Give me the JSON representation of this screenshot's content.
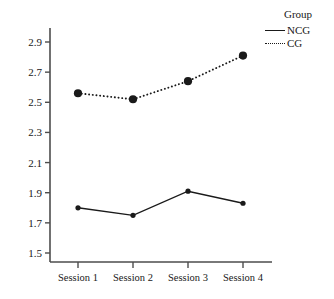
{
  "chart_data": {
    "type": "line",
    "title": "",
    "xlabel": "",
    "ylabel": "",
    "categories": [
      "Session 1",
      "Session 2",
      "Session 3",
      "Session 4"
    ],
    "yticks": [
      "1.5",
      "1.7",
      "1.9",
      "2.1",
      "2.3",
      "2.5",
      "2.7",
      "2.9"
    ],
    "ytick_values": [
      1.5,
      1.7,
      1.9,
      2.1,
      2.3,
      2.5,
      2.7,
      2.9
    ],
    "ylim": [
      1.43,
      2.97
    ],
    "grid": false,
    "legend_position": "top-right",
    "legend_title": "Group",
    "series": [
      {
        "name": "NCG",
        "values": [
          1.8,
          1.75,
          1.91,
          1.83
        ],
        "linestyle": "solid",
        "marker": "circle",
        "marker_size": 4,
        "color": "#1a1a1a"
      },
      {
        "name": "CG",
        "values": [
          2.56,
          2.52,
          2.64,
          2.81
        ],
        "linestyle": "dotted",
        "marker": "circle",
        "marker_size": 7,
        "color": "#1a1a1a"
      }
    ]
  },
  "axes": {
    "axis_color": "#4d4d4d",
    "tick_color": "#4d4d4d"
  },
  "legend": {
    "title": "Group",
    "entries": [
      {
        "label": "NCG",
        "style": "solid"
      },
      {
        "label": "CG",
        "style": "dotted"
      }
    ]
  }
}
